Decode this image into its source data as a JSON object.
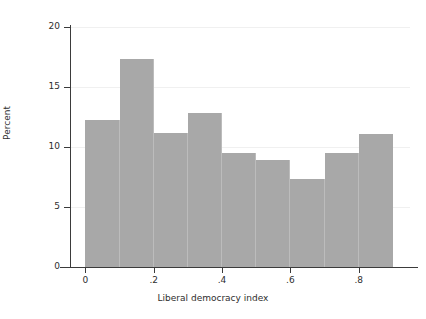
{
  "chart_data": {
    "type": "bar",
    "title": "",
    "subtitle": "",
    "xlabel": "Liberal democracy index",
    "ylabel": "Percent",
    "xlim": [
      -0.045,
      0.95
    ],
    "ylim": [
      0,
      20
    ],
    "grid": true,
    "legend": null,
    "bin_width": 0.1,
    "bin_starts": [
      0.0,
      0.1,
      0.2,
      0.3,
      0.4,
      0.5,
      0.6,
      0.7,
      0.8
    ],
    "categories": [
      "0.0-0.1",
      "0.1-0.2",
      "0.2-0.3",
      "0.3-0.4",
      "0.4-0.5",
      "0.5-0.6",
      "0.6-0.7",
      "0.7-0.8",
      "0.8-0.9"
    ],
    "values": [
      12.25,
      17.35,
      11.2,
      12.8,
      9.5,
      8.9,
      7.3,
      9.5,
      11.1
    ],
    "xticks": [
      0,
      0.2,
      0.4,
      0.6,
      0.8
    ],
    "xtick_labels": [
      "0",
      ".2",
      ".4",
      ".6",
      ".8"
    ],
    "yticks": [
      0,
      5,
      10,
      15,
      20
    ],
    "ytick_labels": [
      "0",
      "5",
      "10",
      "15",
      "20"
    ],
    "bar_color": "#a8a8a8",
    "background_color": "#ffffff",
    "axis_color": "#3b3b3b",
    "gridline_color": "#f0f0f0"
  }
}
